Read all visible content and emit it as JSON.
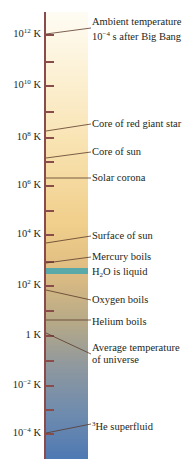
{
  "diagram": {
    "type": "logarithmic temperature scale",
    "unit": "K",
    "colors": {
      "axis": "#8a4b4b",
      "bar_top": "#fefcf4",
      "bar_middle": "#f1cf8c",
      "bar_bottom": "#4f79b3",
      "water_band": "#5aa9a9"
    },
    "major_ticks": [
      {
        "base": "10",
        "exp": "12",
        "unit": " K",
        "y": 34
      },
      {
        "base": "10",
        "exp": "10",
        "unit": " K",
        "y": 85
      },
      {
        "base": "10",
        "exp": "8",
        "unit": " K",
        "y": 137
      },
      {
        "base": "10",
        "exp": "6",
        "unit": " K",
        "y": 185
      },
      {
        "base": "10",
        "exp": "4",
        "unit": " K",
        "y": 234
      },
      {
        "base": "10",
        "exp": "2",
        "unit": " K",
        "y": 285
      },
      {
        "base": "1 K",
        "exp": "",
        "unit": "",
        "y": 335
      },
      {
        "base": "10",
        "exp": "−2",
        "unit": " K",
        "y": 385
      },
      {
        "base": "10",
        "exp": "−4",
        "unit": " K",
        "y": 433
      }
    ],
    "annotations": [
      {
        "line1": "Ambient temperature",
        "line2_pre": "10",
        "line2_sup": "−4",
        "line2_post": " s after Big Bang"
      },
      {
        "text": "Core of red giant star"
      },
      {
        "text": "Core of sun"
      },
      {
        "text": "Solar corona"
      },
      {
        "text": "Surface of sun"
      },
      {
        "text": "Mercury boils"
      },
      {
        "pre": "H",
        "sub": "2",
        "post": "O is liquid"
      },
      {
        "text": "Oxygen boils"
      },
      {
        "text": "Helium boils"
      },
      {
        "line1": "Average temperature",
        "line2": "of universe"
      },
      {
        "sup": "3",
        "post": "He superfluid"
      }
    ]
  }
}
